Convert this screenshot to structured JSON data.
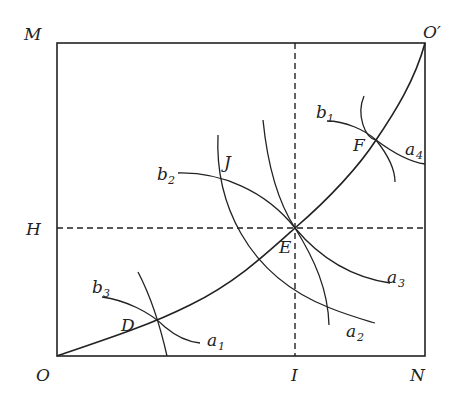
{
  "diagram": {
    "type": "geometric construction",
    "points": {
      "M": "M",
      "O_prime": "O′",
      "H": "H",
      "O": "O",
      "I": "I",
      "N": "N",
      "D": "D",
      "E": "E",
      "F": "F",
      "J": "J"
    },
    "arc_labels": {
      "b1": {
        "base": "b",
        "sub": "1"
      },
      "b2": {
        "base": "b",
        "sub": "2"
      },
      "b3": {
        "base": "b",
        "sub": "3"
      },
      "a1": {
        "base": "a",
        "sub": "1"
      },
      "a2": {
        "base": "a",
        "sub": "2"
      },
      "a3": {
        "base": "a",
        "sub": "3"
      },
      "a4": {
        "base": "a",
        "sub": "4"
      }
    }
  }
}
